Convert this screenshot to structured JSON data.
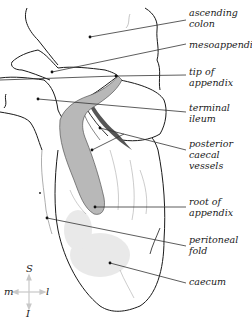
{
  "diagram": {
    "labels": [
      {
        "id": "ascending-colon",
        "text": "ascending\ncolon",
        "x": 189,
        "y": 8
      },
      {
        "id": "mesoappendix",
        "text": "mesoappendix",
        "x": 189,
        "y": 40
      },
      {
        "id": "tip-of-appendix",
        "text": "tip of\nappendix",
        "x": 189,
        "y": 64
      },
      {
        "id": "terminal-ileum",
        "text": "terminal\nileum",
        "x": 189,
        "y": 98
      },
      {
        "id": "posterior-caecal-vessels",
        "text": "posterior\ncaecal\nvessels",
        "x": 189,
        "y": 137
      },
      {
        "id": "root-of-appendix",
        "text": "root of\nappendix",
        "x": 189,
        "y": 194
      },
      {
        "id": "peritoneal-fold",
        "text": "peritoneal\nfold",
        "x": 189,
        "y": 233
      },
      {
        "id": "caecum",
        "text": "caecum",
        "x": 189,
        "y": 275
      }
    ],
    "compass": {
      "superior": "S",
      "inferior": "I",
      "medial": "m",
      "lateral": "l"
    },
    "colors": {
      "outline": "#1a1a1a",
      "appendix_fill": "#b8b8b8",
      "vessel_fill": "#555555",
      "leader_line": "#333333",
      "compass_arrow": "#c8c8c8"
    }
  }
}
